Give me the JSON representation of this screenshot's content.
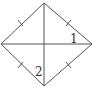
{
  "figure": {
    "type": "rhombus-with-diagonals",
    "stroke_color": "#555555",
    "vertices": {
      "top": [
        44,
        3
      ],
      "left": [
        1,
        44
      ],
      "right": [
        92,
        44
      ],
      "bottom": [
        44,
        86
      ]
    },
    "angle_labels": [
      {
        "text": "1",
        "x": 70,
        "y": 43
      },
      {
        "text": "2",
        "x": 35,
        "y": 76
      }
    ],
    "equal_side_ticks": 4
  }
}
